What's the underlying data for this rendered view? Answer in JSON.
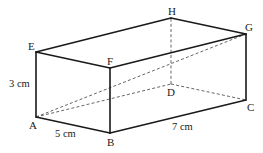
{
  "figure": {
    "type": "cuboid",
    "vertices": {
      "A": {
        "label": "A"
      },
      "B": {
        "label": "B"
      },
      "C": {
        "label": "C"
      },
      "D": {
        "label": "D"
      },
      "E": {
        "label": "E"
      },
      "F": {
        "label": "F"
      },
      "G": {
        "label": "G"
      },
      "H": {
        "label": "H"
      }
    },
    "dimensions": {
      "height": "3 cm",
      "width": "5 cm",
      "length": "7 cm"
    },
    "solid_edges": [
      "AB",
      "BC",
      "CG",
      "GH",
      "HE",
      "EA",
      "EF",
      "FG",
      "FB"
    ],
    "hidden_edges": [
      "AD",
      "DC",
      "DH",
      "AG",
      "AC"
    ]
  }
}
